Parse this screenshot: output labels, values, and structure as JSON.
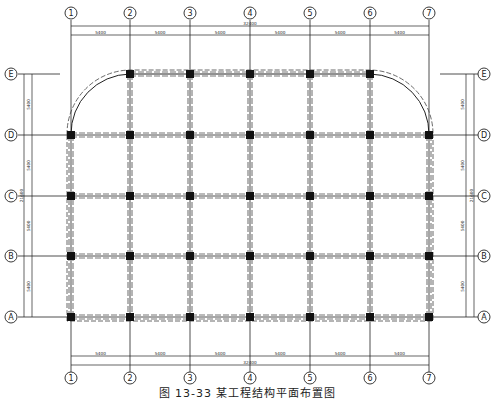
{
  "drawing": {
    "title": "结构平面布置图",
    "caption": "图 13-33    某工程结构平面布置图",
    "colors": {
      "line": "#222222",
      "column": "#111111",
      "beam_dash": "#777777",
      "background": "#ffffff"
    }
  },
  "axes": {
    "vertical": [
      {
        "label": "①",
        "x": 71
      },
      {
        "label": "②",
        "x": 130
      },
      {
        "label": "③",
        "x": 190
      },
      {
        "label": "④",
        "x": 250
      },
      {
        "label": "⑤",
        "x": 310
      },
      {
        "label": "⑥",
        "x": 370
      },
      {
        "label": "⑦",
        "x": 429
      }
    ],
    "horizontal": [
      {
        "label": "Ⓔ",
        "y": 74
      },
      {
        "label": "Ⓓ",
        "y": 135
      },
      {
        "label": "Ⓒ",
        "y": 196
      },
      {
        "label": "Ⓑ",
        "y": 256
      },
      {
        "label": "Ⓐ",
        "y": 317
      }
    ]
  },
  "dimensions": {
    "top": {
      "spans": [
        "5400",
        "5400",
        "5400",
        "5400",
        "5400",
        "5400"
      ],
      "total": "32400"
    },
    "bottom": {
      "spans": [
        "5400",
        "5400",
        "5400",
        "5400",
        "5400",
        "5400"
      ],
      "total": "32400"
    },
    "left": {
      "spans": [
        "5400",
        "5400",
        "5400",
        "5400"
      ],
      "total": "21600"
    },
    "right": {
      "spans": [
        "5400",
        "5400",
        "5400",
        "5400"
      ],
      "total": "21600"
    }
  }
}
